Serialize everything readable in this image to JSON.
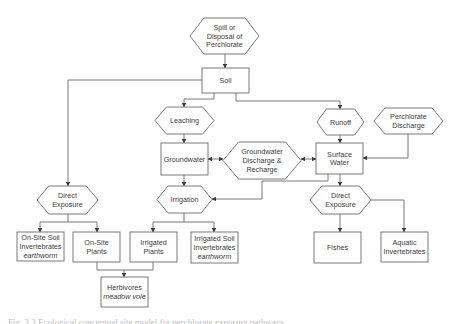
{
  "diagram": {
    "colors": {
      "stroke": "#6a6a6a",
      "text": "#3a3a3a",
      "background": "#ffffff"
    },
    "nodes": [
      {
        "id": "spill",
        "shape": "hex",
        "x": 190,
        "y": 18,
        "w": 69,
        "h": 36,
        "lines": [
          "Spill or",
          "Disposal of",
          "Perchlorate"
        ]
      },
      {
        "id": "soil",
        "shape": "rect",
        "x": 202,
        "y": 68,
        "w": 47,
        "h": 25,
        "lines": [
          "Soil"
        ]
      },
      {
        "id": "leaching",
        "shape": "hex",
        "x": 155,
        "y": 107,
        "w": 59,
        "h": 27,
        "lines": [
          "Leaching"
        ]
      },
      {
        "id": "runoff",
        "shape": "hex",
        "x": 317,
        "y": 109,
        "w": 47,
        "h": 26,
        "lines": [
          "Runoff"
        ]
      },
      {
        "id": "perchlorate-discharge",
        "shape": "hex",
        "x": 374,
        "y": 108,
        "w": 69,
        "h": 26,
        "lines": [
          "Perchlorate",
          "Discharge"
        ]
      },
      {
        "id": "groundwater",
        "shape": "rect",
        "x": 161,
        "y": 143,
        "w": 47,
        "h": 32,
        "lines": [
          "Groundwater"
        ]
      },
      {
        "id": "gw-discharge-recharge",
        "shape": "hex",
        "x": 223,
        "y": 142,
        "w": 78,
        "h": 37,
        "lines": [
          "Groundwater",
          "Discharge &",
          "Recharge"
        ]
      },
      {
        "id": "surface-water",
        "shape": "rect",
        "x": 316,
        "y": 143,
        "w": 47,
        "h": 31,
        "lines": [
          "Surface",
          "Water"
        ]
      },
      {
        "id": "direct-exposure-soil",
        "shape": "hex",
        "x": 37,
        "y": 186,
        "w": 61,
        "h": 28,
        "lines": [
          "Direct",
          "Exposure"
        ]
      },
      {
        "id": "irrigation",
        "shape": "hex",
        "x": 157,
        "y": 186,
        "w": 55,
        "h": 27,
        "lines": [
          "Irrigation"
        ]
      },
      {
        "id": "direct-exposure-water",
        "shape": "hex",
        "x": 310,
        "y": 186,
        "w": 61,
        "h": 28,
        "lines": [
          "Direct",
          "Exposure"
        ]
      },
      {
        "id": "onsite-soil-inverts",
        "shape": "rect",
        "x": 17,
        "y": 232,
        "w": 47,
        "h": 29,
        "lines": [
          "On-Site Soil",
          "Invertebrates"
        ],
        "italic_line": "earthworm"
      },
      {
        "id": "onsite-plants",
        "shape": "rect",
        "x": 73,
        "y": 232,
        "w": 47,
        "h": 30,
        "lines": [
          "On-Site",
          "Plants"
        ]
      },
      {
        "id": "irrigated-plants",
        "shape": "rect",
        "x": 130,
        "y": 232,
        "w": 47,
        "h": 30,
        "lines": [
          "Irrigated",
          "Plants"
        ]
      },
      {
        "id": "irrigated-soil-inverts",
        "shape": "rect",
        "x": 191,
        "y": 232,
        "w": 47,
        "h": 31,
        "lines": [
          "Irrigated Soil",
          "Invertebrates"
        ],
        "italic_line": "earthworm"
      },
      {
        "id": "fishes",
        "shape": "rect",
        "x": 314,
        "y": 232,
        "w": 47,
        "h": 31,
        "lines": [
          "Fishes"
        ]
      },
      {
        "id": "aquatic-inverts",
        "shape": "rect",
        "x": 381,
        "y": 232,
        "w": 47,
        "h": 30,
        "lines": [
          "Aquatic",
          "Invertebrates"
        ]
      },
      {
        "id": "herbivores",
        "shape": "rect",
        "x": 101,
        "y": 277,
        "w": 47,
        "h": 30,
        "lines": [
          "Herbivores"
        ],
        "italic_line": "meadow vole"
      }
    ],
    "edges": [
      {
        "id": "spill-to-soil",
        "points": [
          [
            225,
            54
          ],
          [
            225,
            68
          ]
        ],
        "arrow_end": true
      },
      {
        "id": "soil-to-leaching",
        "points": [
          [
            214,
            93
          ],
          [
            214,
            99
          ],
          [
            184,
            99
          ],
          [
            184,
            107
          ]
        ],
        "arrow_end": true
      },
      {
        "id": "soil-to-runoff",
        "points": [
          [
            236,
            93
          ],
          [
            236,
            101
          ],
          [
            340,
            101
          ],
          [
            340,
            109
          ]
        ],
        "arrow_end": true
      },
      {
        "id": "soil-to-direct-exposure",
        "points": [
          [
            202,
            80
          ],
          [
            68,
            80
          ],
          [
            68,
            186
          ]
        ],
        "arrow_end": true
      },
      {
        "id": "leaching-to-groundwater",
        "points": [
          [
            184,
            134
          ],
          [
            184,
            143
          ]
        ],
        "arrow_end": true
      },
      {
        "id": "runoff-to-surface-water",
        "points": [
          [
            340,
            135
          ],
          [
            340,
            143
          ]
        ],
        "arrow_end": true
      },
      {
        "id": "perchlorate-to-surface-water",
        "points": [
          [
            408,
            134
          ],
          [
            408,
            158
          ],
          [
            363,
            158
          ]
        ],
        "arrow_end": true
      },
      {
        "id": "groundwater-gw-discharge",
        "points": [
          [
            208,
            159
          ],
          [
            223,
            159
          ]
        ],
        "arrow_end": true,
        "arrow_start": true
      },
      {
        "id": "gw-discharge-surface-water",
        "points": [
          [
            301,
            159
          ],
          [
            316,
            159
          ]
        ],
        "arrow_end": true,
        "arrow_start": true
      },
      {
        "id": "groundwater-to-irrigation",
        "points": [
          [
            184,
            175
          ],
          [
            184,
            186
          ]
        ],
        "arrow_end": true
      },
      {
        "id": "surface-water-to-irrigation",
        "points": [
          [
            328,
            174
          ],
          [
            328,
            181
          ],
          [
            262,
            181
          ],
          [
            262,
            199
          ],
          [
            212,
            199
          ]
        ],
        "arrow_end": true
      },
      {
        "id": "surface-water-to-direct-exposure",
        "points": [
          [
            340,
            174
          ],
          [
            340,
            186
          ]
        ],
        "arrow_end": true
      },
      {
        "id": "de-soil-to-soil-inverts",
        "points": [
          [
            68,
            214
          ],
          [
            68,
            222
          ],
          [
            40,
            222
          ],
          [
            40,
            232
          ]
        ],
        "arrow_end": true
      },
      {
        "id": "de-soil-to-plants",
        "points": [
          [
            68,
            222
          ],
          [
            97,
            222
          ],
          [
            97,
            232
          ]
        ],
        "arrow_end": true
      },
      {
        "id": "irrigation-to-plants",
        "points": [
          [
            184,
            213
          ],
          [
            184,
            222
          ],
          [
            153,
            222
          ],
          [
            153,
            232
          ]
        ],
        "arrow_end": true
      },
      {
        "id": "irrigation-to-soil-inverts",
        "points": [
          [
            184,
            222
          ],
          [
            214,
            222
          ],
          [
            214,
            232
          ]
        ],
        "arrow_end": true
      },
      {
        "id": "de-water-to-fishes",
        "points": [
          [
            340,
            214
          ],
          [
            340,
            232
          ]
        ],
        "arrow_end": true
      },
      {
        "id": "de-water-to-aquatic",
        "points": [
          [
            371,
            200
          ],
          [
            404,
            200
          ],
          [
            404,
            232
          ]
        ],
        "arrow_end": true
      },
      {
        "id": "onsite-plants-to-herbivores",
        "points": [
          [
            97,
            262
          ],
          [
            97,
            270
          ],
          [
            124,
            270
          ],
          [
            124,
            277
          ]
        ],
        "arrow_end": true
      },
      {
        "id": "irrigated-plants-to-herbivores",
        "points": [
          [
            153,
            262
          ],
          [
            153,
            270
          ],
          [
            124,
            270
          ]
        ],
        "arrow_end": false
      }
    ]
  },
  "caption": {
    "text": "Fig. 3.3  Ecological conceptual site model for perchlorate exposure pathways"
  }
}
